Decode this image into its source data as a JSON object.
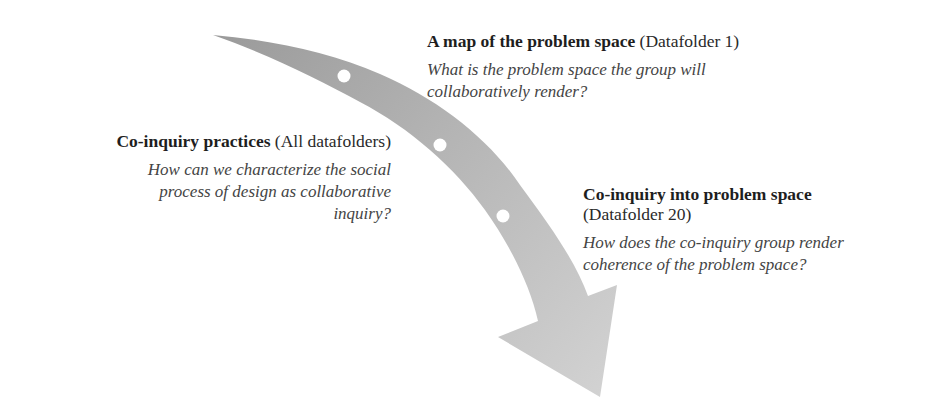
{
  "diagram": {
    "type": "curved-arrow-process",
    "arrow": {
      "color_start": "#9a9a9a",
      "color_end": "#cfcfcf",
      "milestone_dots": 3,
      "dot_color": "#ffffff"
    },
    "blocks": [
      {
        "id": "map",
        "title": "A map of the problem space",
        "paren": "(Datafolder 1)",
        "question_lines": [
          "What is the problem space the group will",
          "collaboratively render?"
        ]
      },
      {
        "id": "practices",
        "title": "Co-inquiry practices",
        "paren": "(All datafolders)",
        "question_lines": [
          "How can we characterize the social",
          "process of design as collaborative",
          "inquiry?"
        ]
      },
      {
        "id": "coinquiry",
        "title": "Co-inquiry into problem space",
        "paren": "(Datafolder 20)",
        "question_lines": [
          "How does the co-inquiry group render",
          "coherence of the problem space?"
        ]
      }
    ]
  }
}
